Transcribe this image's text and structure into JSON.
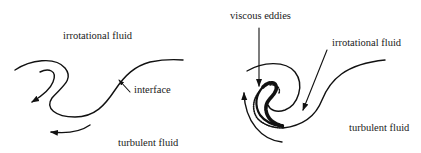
{
  "diagram": {
    "left_panel": {
      "labels": {
        "top": "irrotational fluid",
        "interface": "interface",
        "bottom": "turbulent fluid"
      }
    },
    "right_panel": {
      "labels": {
        "eddies": "viscous eddies",
        "top": "irrotational fluid",
        "bottom": "turbulent fluid"
      }
    },
    "colors": {
      "stroke": "#111111",
      "background": "#ffffff"
    }
  }
}
